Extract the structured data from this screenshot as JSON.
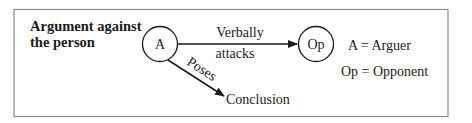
{
  "title_line1": "Argument against",
  "title_line2": "the person",
  "nodes": {
    "arguer": "A",
    "opponent": "Op",
    "conclusion": "Conclusion"
  },
  "edges": {
    "attack_label_1": "Verbally",
    "attack_label_2": "attacks",
    "poses_label": "Poses"
  },
  "legend": {
    "line1": "A = Arguer",
    "line2": "Op = Opponent"
  },
  "colors": {
    "ink": "#1a1a1a",
    "frame": "#8a8a8a"
  }
}
